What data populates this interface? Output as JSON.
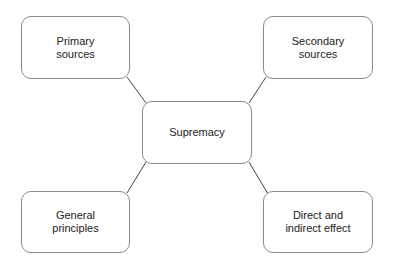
{
  "diagram": {
    "type": "hub-and-spoke",
    "center": {
      "id": "supremacy",
      "label": "Supremacy"
    },
    "nodes": [
      {
        "id": "primary",
        "label": "Primary\nsources"
      },
      {
        "id": "secondary",
        "label": "Secondary\nsources"
      },
      {
        "id": "general",
        "label": "General\nprinciples"
      },
      {
        "id": "direct",
        "label": "Direct and\nindirect effect"
      }
    ],
    "edges": [
      {
        "from": "supremacy",
        "to": "primary"
      },
      {
        "from": "supremacy",
        "to": "secondary"
      },
      {
        "from": "supremacy",
        "to": "general"
      },
      {
        "from": "supremacy",
        "to": "direct"
      }
    ],
    "colors": {
      "node_border": "#8a8a8a",
      "edge": "#444444",
      "text": "#222222",
      "background": "#ffffff"
    }
  }
}
